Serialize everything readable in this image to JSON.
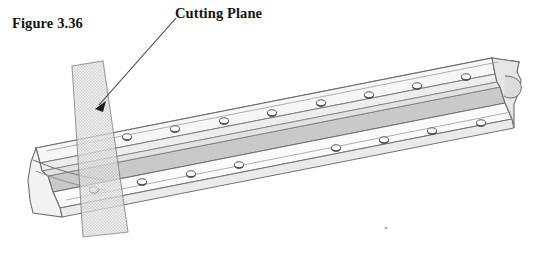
{
  "figure": {
    "caption": "Figure 3.36",
    "background_color": "#ffffff"
  },
  "annotations": {
    "cutting_plane_label": "Cutting Plane",
    "leader_arrow": {
      "name": "leader-arrow",
      "from_x": 176,
      "from_y": 18,
      "to_x": 96,
      "to_y": 108,
      "color": "#3c3c3c"
    }
  },
  "drawing": {
    "title": "angle-bracket-with-cutting-plane",
    "type": "isometric-technical-illustration",
    "subject": "perforated L-shaped angle bracket",
    "line_color": "#6e6e6e",
    "dark_line_color": "#4a4a4a",
    "fill_light": "#fbfbfb",
    "fill_mid": "#ededed",
    "fill_dark": "#cfcfcf",
    "fill_web": "#c9c9c9",
    "cutting_plane": {
      "name": "cutting-plane",
      "fill": "#f0f0f0",
      "stroke": "#7a7a7a",
      "opacity": 0.72,
      "hatch": "checker-stipple",
      "hatch_color": "#b4b4b4",
      "points": "72,66 103,61 128,232 83,237"
    },
    "upper_flange_holes": [
      {
        "cx": 127,
        "cy": 137,
        "rx": 4.6,
        "ry": 3.2
      },
      {
        "cx": 175,
        "cy": 129,
        "rx": 4.6,
        "ry": 3.2
      },
      {
        "cx": 224,
        "cy": 121,
        "rx": 4.6,
        "ry": 3.2
      },
      {
        "cx": 272,
        "cy": 113,
        "rx": 4.6,
        "ry": 3.2
      },
      {
        "cx": 321,
        "cy": 103,
        "rx": 4.6,
        "ry": 3.2
      },
      {
        "cx": 369,
        "cy": 95,
        "rx": 4.6,
        "ry": 3.2
      },
      {
        "cx": 417,
        "cy": 86,
        "rx": 4.6,
        "ry": 3.2
      },
      {
        "cx": 466,
        "cy": 77,
        "rx": 4.6,
        "ry": 3.2
      }
    ],
    "lower_flange_holes": [
      {
        "cx": 94,
        "cy": 190,
        "rx": 4.6,
        "ry": 3.2
      },
      {
        "cx": 142,
        "cy": 182,
        "rx": 4.6,
        "ry": 3.2
      },
      {
        "cx": 191,
        "cy": 174,
        "rx": 4.6,
        "ry": 3.2
      },
      {
        "cx": 239,
        "cy": 165,
        "rx": 4.6,
        "ry": 3.2
      },
      {
        "cx": 336,
        "cy": 148,
        "rx": 4.6,
        "ry": 3.2
      },
      {
        "cx": 384,
        "cy": 140,
        "rx": 4.6,
        "ry": 3.2
      },
      {
        "cx": 432,
        "cy": 131,
        "rx": 4.6,
        "ry": 3.2
      },
      {
        "cx": 481,
        "cy": 123,
        "rx": 4.6,
        "ry": 3.2
      }
    ],
    "speck": {
      "cx": 386,
      "cy": 228,
      "r": 1.1,
      "color": "#8a8a8a"
    }
  }
}
